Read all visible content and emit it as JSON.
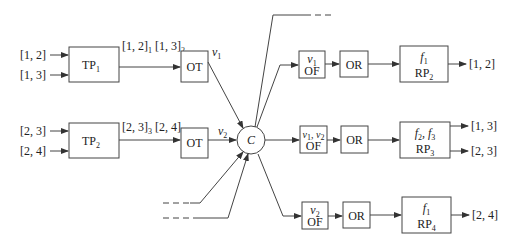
{
  "diagram": {
    "inputs_left": [
      {
        "label": "[1, 2]"
      },
      {
        "label": "[1, 3]"
      },
      {
        "label": "[2, 3]"
      },
      {
        "label": "[2, 4]"
      }
    ],
    "tp_blocks": [
      {
        "name": "TP",
        "sub": "1",
        "output_label": "[1, 2]",
        "output_sub_a": "1",
        "output_label_b": "[1, 3]",
        "output_sub_b": "2"
      },
      {
        "name": "TP",
        "sub": "2",
        "output_label": "[2, 3]",
        "output_sub_a": "3",
        "output_label_b": "[2, 4]",
        "output_sub_b": "1"
      }
    ],
    "ot_blocks": [
      {
        "name": "OT",
        "signal": "v",
        "signal_sub": "1"
      },
      {
        "name": "OT",
        "signal": "v",
        "signal_sub": "2"
      }
    ],
    "center": {
      "label": "C"
    },
    "of_blocks": [
      {
        "signal": "v",
        "signal_sub": "1",
        "signal_extra": "",
        "name": "OF"
      },
      {
        "signal": "v",
        "signal_sub": "1",
        "signal_extra": ", v",
        "signal_extra_sub": "2",
        "name": "OF"
      },
      {
        "signal": "v",
        "signal_sub": "2",
        "signal_extra": "",
        "name": "OF"
      }
    ],
    "or_blocks": [
      {
        "name": "OR"
      },
      {
        "name": "OR"
      },
      {
        "name": "OR"
      }
    ],
    "rp_blocks": [
      {
        "func": "f",
        "func_sub": "1",
        "func_extra": "",
        "name": "RP",
        "sub": "2",
        "outputs": [
          "[1, 2]"
        ]
      },
      {
        "func": "f",
        "func_sub": "2",
        "func_extra": ", f",
        "func_extra_sub": "3",
        "name": "RP",
        "sub": "3",
        "outputs": [
          "[1, 3]",
          "[2, 3]"
        ]
      },
      {
        "func": "f",
        "func_sub": "1",
        "func_extra": "",
        "name": "RP",
        "sub": "4",
        "outputs": [
          "[2, 4]"
        ]
      }
    ]
  }
}
